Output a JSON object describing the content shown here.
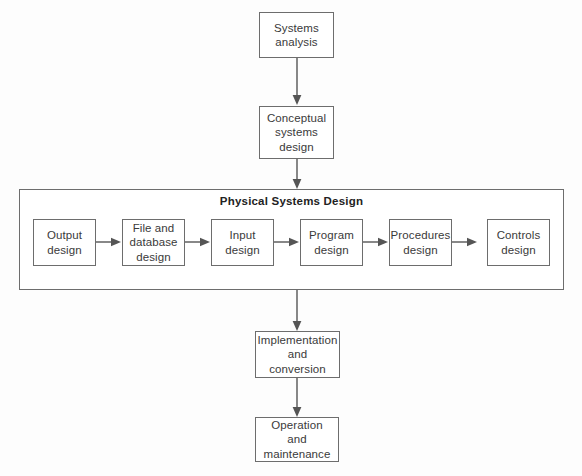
{
  "diagram": {
    "stroke_color": "#6d6d6d",
    "text_color": "#3a3a3a",
    "background": "#fdfdfd"
  },
  "nodes": {
    "systems_analysis": "Systems\nanalysis",
    "conceptual_systems_design": "Conceptual\nsystems\ndesign",
    "implementation_and_conversion": "Implementation\nand\nconversion",
    "operation_and_maintenance": "Operation\nand\nmaintenance"
  },
  "group": {
    "title": "Physical Systems Design",
    "steps": [
      {
        "id": "output-design",
        "label": "Output\ndesign"
      },
      {
        "id": "file-and-database-design",
        "label": "File and\ndatabase\ndesign"
      },
      {
        "id": "input-design",
        "label": "Input\ndesign"
      },
      {
        "id": "program-design",
        "label": "Program\ndesign"
      },
      {
        "id": "procedures-design",
        "label": "Procedures\ndesign"
      },
      {
        "id": "controls-design",
        "label": "Controls\ndesign"
      }
    ]
  },
  "connectors": [
    {
      "id": "analysis-to-conceptual",
      "direction": "down"
    },
    {
      "id": "conceptual-to-physical",
      "direction": "down"
    },
    {
      "id": "physical-to-implementation",
      "direction": "down"
    },
    {
      "id": "implementation-to-operation",
      "direction": "down"
    },
    {
      "id": "output-to-file",
      "direction": "right"
    },
    {
      "id": "file-to-input",
      "direction": "right"
    },
    {
      "id": "input-to-program",
      "direction": "right"
    },
    {
      "id": "program-to-procedures",
      "direction": "right"
    },
    {
      "id": "procedures-to-controls",
      "direction": "right"
    }
  ]
}
